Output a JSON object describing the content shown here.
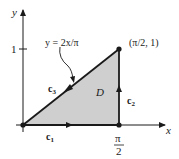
{
  "diagram": {
    "axes": {
      "x_label": "x",
      "y_label": "y",
      "y_tick_label": "1",
      "x_tick_label_numerator": "π",
      "x_tick_label_denominator": "2"
    },
    "curve_label": "y = 2x/π",
    "point_label": "(π/2, 1)",
    "region_label": "D",
    "paths": {
      "c1": "c",
      "c1_sub": "1",
      "c2": "c",
      "c2_sub": "2",
      "c3": "c",
      "c3_sub": "3"
    },
    "colors": {
      "region_fill": "#cfcfcf",
      "line": "#1a1a1a"
    }
  }
}
